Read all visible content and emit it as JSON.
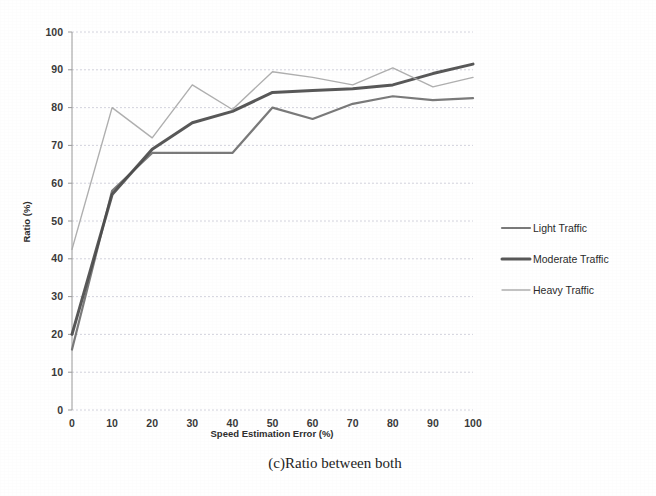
{
  "caption": "(c)Ratio between both",
  "chart_data": {
    "type": "line",
    "title": "",
    "xlabel": "Speed Estimation Error (%)",
    "ylabel": "Ratio (%)",
    "xlim": [
      0,
      100
    ],
    "ylim": [
      0,
      100
    ],
    "xticks": [
      "0",
      "10",
      "20",
      "30",
      "40",
      "50",
      "60",
      "70",
      "80",
      "90",
      "100"
    ],
    "yticks": [
      "0",
      "10",
      "20",
      "30",
      "40",
      "50",
      "60",
      "70",
      "80",
      "90",
      "100"
    ],
    "grid": true,
    "legend_position": "right",
    "x": [
      0,
      10,
      20,
      30,
      40,
      50,
      60,
      70,
      80,
      90,
      100
    ],
    "series": [
      {
        "name": "Light Traffic",
        "color": "#6f6f6f",
        "width": 2.2,
        "values": [
          16,
          58,
          68,
          68,
          68,
          80,
          77,
          81,
          83,
          82,
          82.5
        ]
      },
      {
        "name": "Moderate Traffic",
        "color": "#4a4a4a",
        "width": 3.0,
        "values": [
          20,
          57,
          69,
          76,
          79,
          84,
          84.5,
          85,
          86,
          89,
          91.5
        ]
      },
      {
        "name": "Heavy Traffic",
        "color": "#a8a8a8",
        "width": 1.4,
        "values": [
          42.5,
          80,
          72,
          86,
          79.5,
          89.5,
          88,
          86,
          90.5,
          85.5,
          88
        ]
      }
    ]
  },
  "legend": {
    "items": [
      {
        "label": "Light Traffic"
      },
      {
        "label": "Moderate Traffic"
      },
      {
        "label": "Heavy Traffic"
      }
    ]
  },
  "colors": {
    "grid": "#c9c9d6",
    "axis": "#9a9a9a",
    "text": "#2e2e2e",
    "background": "#ffffff"
  }
}
